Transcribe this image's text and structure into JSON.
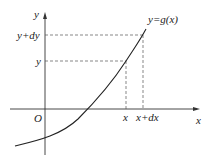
{
  "diagram": {
    "type": "function-graph-differential",
    "axes": {
      "x_label": "x",
      "y_label": "y",
      "origin_label": "O"
    },
    "curve_label": "y=g(x)",
    "y_ticks": [
      {
        "label": "y",
        "level": "y"
      },
      {
        "label": "y+dy",
        "level": "y+dy"
      }
    ],
    "x_ticks": [
      {
        "label": "x",
        "level": "x"
      },
      {
        "label": "x+dx",
        "level": "x+dx"
      }
    ],
    "colors": {
      "curve": "#222222",
      "axes": "#333333",
      "dashed": "#555555",
      "background": "#ffffff"
    }
  }
}
